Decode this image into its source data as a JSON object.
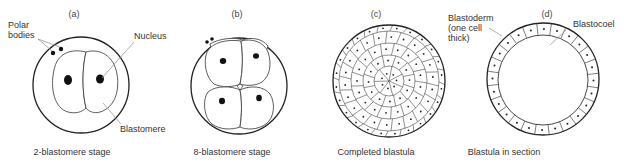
{
  "figure": {
    "panels": [
      {
        "id": "a",
        "panel_label": "(a)",
        "caption": "2-blastomere stage",
        "labels": {
          "polar_bodies": [
            "Polar",
            "bodies"
          ],
          "nucleus": "Nucleus",
          "blastomere": "Blastomere"
        }
      },
      {
        "id": "b",
        "panel_label": "(b)",
        "caption": "8-blastomere stage"
      },
      {
        "id": "c",
        "panel_label": "(c)",
        "caption": "Completed blastula"
      },
      {
        "id": "d",
        "panel_label": "(d)",
        "caption": "Blastula in section",
        "labels": {
          "blastoderm": [
            "Blastoderm",
            "(one cell",
            "thick)"
          ],
          "blastocoel": "Blastocoel"
        }
      }
    ]
  },
  "colors": {
    "line": "#222222",
    "leader": "#9a9a9a",
    "text": "#333333"
  }
}
